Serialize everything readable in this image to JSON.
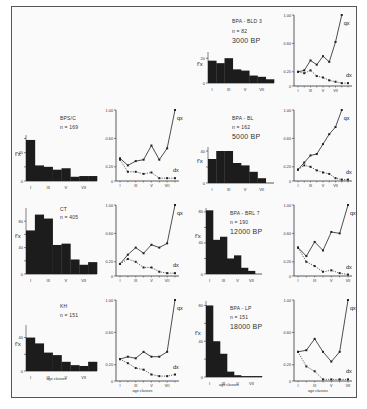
{
  "figure": {
    "x_tick_labels": [
      "I",
      "III",
      "V",
      "VII"
    ],
    "x_axis_label": "age classes",
    "hist_ylabel": "f'x",
    "line_ylabel_ticks": [
      "0",
      "0.20",
      "0.60",
      "1.00"
    ],
    "series_labels": {
      "q": "qx",
      "d": "dx"
    }
  },
  "panels": [
    {
      "id": "bpa-bld3",
      "name": "BPA - BLD 3",
      "n": "n = 82",
      "date": "3000 BP",
      "hist_yticks": [
        "0",
        "20"
      ],
      "hist_max": 25
    },
    {
      "id": "bps-c",
      "name": "BPS/C",
      "n": "n = 169",
      "date": "",
      "hist_yticks": [
        "0",
        "40"
      ],
      "hist_max": 65
    },
    {
      "id": "bpa-bl",
      "name": "BPA - BL",
      "n": "n = 162",
      "date": "5000 BP",
      "hist_yticks": [
        "0",
        "20",
        "40"
      ],
      "hist_max": 45
    },
    {
      "id": "ct",
      "name": "CT",
      "n": "n = 405",
      "date": "",
      "hist_yticks": [
        "0",
        "40",
        "80"
      ],
      "hist_max": 100
    },
    {
      "id": "bpa-brl7",
      "name": "BPA - BRL 7",
      "n": "n = 190",
      "date": "12000 BP",
      "hist_yticks": [
        "0",
        "40",
        "80"
      ],
      "hist_max": 85
    },
    {
      "id": "kh",
      "name": "KH",
      "n": "n = 151",
      "date": "",
      "hist_yticks": [
        "0",
        "40"
      ],
      "hist_max": 55
    },
    {
      "id": "bpa-lp",
      "name": "BPA - LP",
      "n": "n = 151",
      "date": "18000 BP",
      "hist_yticks": [
        "0",
        "40",
        "80"
      ],
      "hist_max": 85
    }
  ],
  "chart_data": [
    {
      "type": "bar",
      "title": "BPA - BLD 3 (n = 82) 3000 BP — f'x",
      "categories": [
        "I",
        "II",
        "III",
        "IV",
        "V",
        "VI",
        "VII",
        "VIII"
      ],
      "values": [
        18,
        16,
        20,
        11,
        10,
        6,
        5,
        3
      ],
      "ylabel": "f'x",
      "ylim": [
        0,
        25
      ]
    },
    {
      "type": "line",
      "title": "BPA - BLD 3 — qx, dx",
      "x": [
        1,
        2,
        3,
        4,
        5,
        6,
        7,
        8,
        9
      ],
      "series": [
        {
          "name": "qx",
          "values": [
            0.2,
            0.22,
            0.36,
            0.3,
            0.42,
            0.34,
            0.62,
            1.0
          ]
        },
        {
          "name": "dx",
          "values": [
            0.2,
            0.18,
            0.22,
            0.14,
            0.12,
            0.08,
            0.06,
            0.04,
            0.04
          ]
        }
      ],
      "xticks": [
        "I",
        "III",
        "V",
        "VII"
      ],
      "ylim": [
        0,
        1.0
      ]
    },
    {
      "type": "bar",
      "title": "BPS/C (n = 169) — f'x",
      "categories": [
        "I",
        "II",
        "III",
        "IV",
        "V",
        "VI",
        "VII",
        "VIII"
      ],
      "values": [
        58,
        22,
        20,
        16,
        18,
        6,
        7,
        7
      ],
      "ylabel": "f'x",
      "ylim": [
        0,
        65
      ]
    },
    {
      "type": "line",
      "title": "BPS/C — qx, dx",
      "x": [
        1,
        2,
        3,
        4,
        5,
        6,
        7,
        8
      ],
      "series": [
        {
          "name": "qx",
          "values": [
            0.32,
            0.22,
            0.28,
            0.3,
            0.5,
            0.3,
            0.46,
            1.0
          ]
        },
        {
          "name": "dx",
          "values": [
            0.3,
            0.13,
            0.13,
            0.1,
            0.12,
            0.04,
            0.04,
            0.04
          ]
        }
      ],
      "xticks": [
        "I",
        "III",
        "V",
        "VII"
      ],
      "ylim": [
        0,
        1.0
      ]
    },
    {
      "type": "bar",
      "title": "BPA - BL (n = 162) 5000 BP — f'x",
      "categories": [
        "I",
        "II",
        "III",
        "IV",
        "V",
        "VI",
        "VII",
        "VIII"
      ],
      "values": [
        30,
        40,
        40,
        25,
        22,
        14,
        6,
        0
      ],
      "ylabel": "f'x",
      "ylim": [
        0,
        45
      ]
    },
    {
      "type": "line",
      "title": "BPA - BL — qx, dx",
      "x": [
        1,
        2,
        3,
        4,
        5,
        6,
        7,
        8,
        9
      ],
      "series": [
        {
          "name": "qx",
          "values": [
            0.16,
            0.26,
            0.36,
            0.38,
            0.52,
            0.66,
            0.76,
            1.0
          ]
        },
        {
          "name": "dx",
          "values": [
            0.16,
            0.22,
            0.2,
            0.15,
            0.12,
            0.1,
            0.04,
            0.02,
            0.02
          ]
        }
      ],
      "xticks": [
        "I",
        "III",
        "V",
        "VII"
      ],
      "ylim": [
        0,
        1.0
      ]
    },
    {
      "type": "bar",
      "title": "CT (n = 405) — f'x",
      "categories": [
        "I",
        "II",
        "III",
        "IV",
        "V",
        "VI",
        "VII",
        "VIII"
      ],
      "values": [
        66,
        90,
        84,
        44,
        46,
        22,
        14,
        18
      ],
      "ylabel": "f'x",
      "ylim": [
        0,
        100
      ]
    },
    {
      "type": "line",
      "title": "CT — qx, dx",
      "x": [
        1,
        2,
        3,
        4,
        5,
        6,
        7,
        8,
        9
      ],
      "series": [
        {
          "name": "qx",
          "values": [
            0.17,
            0.3,
            0.4,
            0.32,
            0.44,
            0.4,
            0.46,
            1.0
          ]
        },
        {
          "name": "dx",
          "values": [
            0.17,
            0.24,
            0.2,
            0.12,
            0.12,
            0.06,
            0.04,
            0.04
          ]
        }
      ],
      "xticks": [
        "I",
        "III",
        "V",
        "VII"
      ],
      "ylim": [
        0,
        1.0
      ]
    },
    {
      "type": "bar",
      "title": "BPA - BRL 7 (n = 190) 12000 BP — f'x",
      "categories": [
        "I",
        "II",
        "III",
        "IV",
        "V",
        "VI",
        "VII",
        "VIII"
      ],
      "values": [
        82,
        44,
        48,
        20,
        24,
        8,
        4,
        0
      ],
      "ylabel": "f'x",
      "ylim": [
        0,
        85
      ]
    },
    {
      "type": "line",
      "title": "BPA - BRL 7 — qx, dx",
      "x": [
        1,
        2,
        3,
        4,
        5,
        6,
        7,
        8
      ],
      "series": [
        {
          "name": "qx",
          "values": [
            0.4,
            0.28,
            0.48,
            0.36,
            0.62,
            0.6,
            1.0
          ]
        },
        {
          "name": "dx",
          "values": [
            0.4,
            0.2,
            0.14,
            0.06,
            0.08,
            0.04,
            0.02
          ]
        }
      ],
      "xticks": [
        "I",
        "III",
        "V",
        "VII"
      ],
      "ylim": [
        0,
        1.0
      ]
    },
    {
      "type": "bar",
      "title": "KH (n = 151) — f'x",
      "categories": [
        "I",
        "II",
        "III",
        "IV",
        "V",
        "VI",
        "VII",
        "VIII"
      ],
      "values": [
        40,
        33,
        22,
        19,
        11,
        7,
        6,
        11
      ],
      "ylabel": "f'x",
      "ylim": [
        0,
        55
      ]
    },
    {
      "type": "line",
      "title": "KH — qx, dx",
      "x": [
        1,
        2,
        3,
        4,
        5,
        6,
        7,
        8,
        9
      ],
      "series": [
        {
          "name": "qx",
          "values": [
            0.27,
            0.3,
            0.28,
            0.36,
            0.3,
            0.3,
            0.36,
            1.0
          ]
        },
        {
          "name": "dx",
          "values": [
            0.27,
            0.22,
            0.16,
            0.14,
            0.08,
            0.06,
            0.06,
            0.08
          ]
        }
      ],
      "xticks": [
        "I",
        "III",
        "V",
        "VII"
      ],
      "ylim": [
        0,
        1.0
      ]
    },
    {
      "type": "bar",
      "title": "BPA - LP (n = 151) 18000 BP — f'x",
      "categories": [
        "I",
        "II",
        "III",
        "IV",
        "V",
        "VI",
        "VII",
        "VIII"
      ],
      "values": [
        80,
        40,
        26,
        6,
        2,
        1,
        1,
        1
      ],
      "ylabel": "f'x",
      "ylim": [
        0,
        85
      ]
    },
    {
      "type": "line",
      "title": "BPA - LP — qx, dx",
      "x": [
        1,
        2,
        3,
        4,
        5,
        6,
        7,
        8
      ],
      "series": [
        {
          "name": "qx",
          "values": [
            0.36,
            0.38,
            0.52,
            0.36,
            0.24,
            0.36,
            1.0
          ]
        },
        {
          "name": "dx",
          "values": [
            0.36,
            0.18,
            0.12,
            0.02,
            0.02,
            0.02,
            0.02
          ]
        }
      ],
      "xticks": [
        "I",
        "III",
        "V",
        "VII"
      ],
      "ylim": [
        0,
        1.0
      ]
    }
  ]
}
